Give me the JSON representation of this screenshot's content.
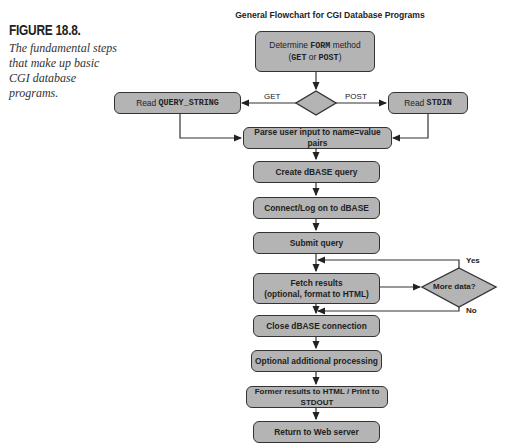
{
  "caption": {
    "figure_number": "FIGURE 18.8.",
    "text": "The fundamental steps that make up basic CGI database programs."
  },
  "diagram": {
    "title": "General Flowchart for CGI Database Programs",
    "nodes": {
      "determine": {
        "pre": "Determine ",
        "kw1": "FORM",
        "post": " method",
        "line2_pre": "(",
        "kw2": "GET",
        "mid": " or ",
        "kw3": "POST",
        "line2_post": ")"
      },
      "method_decision": {
        "shape": "diamond",
        "label": ""
      },
      "read_query": {
        "pre": "Read ",
        "kw": "QUERY_STRING"
      },
      "read_stdin": {
        "pre": "Read ",
        "kw": "STDIN"
      },
      "parse": {
        "label": "Parse user input to name=value pairs"
      },
      "create": {
        "label": "Create dBASE query"
      },
      "connect": {
        "label": "Connect/Log on to dBASE"
      },
      "submit": {
        "label": "Submit query"
      },
      "fetch": {
        "line1": "Fetch results",
        "line2": "(optional, format to HTML)"
      },
      "more_data": {
        "label": "More data?"
      },
      "close": {
        "label": "Close dBASE connection"
      },
      "optional": {
        "label": "Optional additional processing"
      },
      "former": {
        "label": "Former results to HTML / Print to STDOUT"
      },
      "return": {
        "label": "Return to Web server"
      }
    },
    "edge_labels": {
      "get": "GET",
      "post": "POST",
      "yes": "Yes",
      "no": "No"
    },
    "colors": {
      "box_fill": "#b4b4b4",
      "stroke": "#333333"
    }
  }
}
